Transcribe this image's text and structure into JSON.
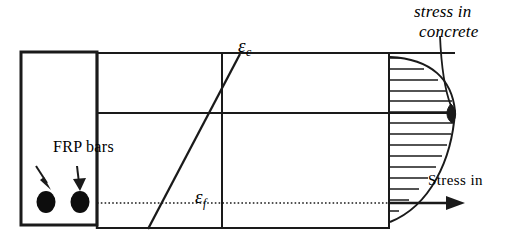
{
  "figure": {
    "background_color": "#ffffff",
    "line_color": "#1a1a1a"
  },
  "labels": {
    "frp_bars": "FRP bars",
    "strain_concrete_symbol": "ε",
    "strain_concrete_subscript": "c",
    "strain_frp_symbol": "ε",
    "strain_frp_subscript": "f",
    "stress_in": "Stress in",
    "stress_in_concrete_line1": "stress in",
    "stress_in_concrete_line2": "concrete"
  },
  "geometry": {
    "cross_section": {
      "x": 21,
      "y": 52,
      "width": 76,
      "height": 173
    },
    "diagram_panel": {
      "x": 97,
      "y": 52,
      "width": 300,
      "height": 177
    },
    "neutral_axis_y": 113,
    "vertical_axis_x": 222,
    "stress_axis_x": 386,
    "frp_level_y": 203,
    "bars": [
      {
        "cx": 46,
        "cy": 202,
        "rx": 9,
        "ry": 11
      },
      {
        "cx": 80,
        "cy": 202,
        "rx": 9,
        "ry": 11
      }
    ],
    "stress_block": {
      "left_x": 390,
      "top_y": 57,
      "bottom_y": 222,
      "max_x": 455,
      "hatch_count": 14
    }
  }
}
